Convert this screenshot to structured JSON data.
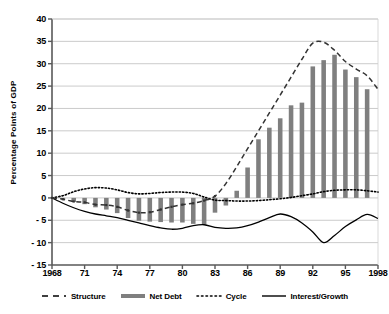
{
  "chart_data": {
    "type": "bar",
    "title": "",
    "xlabel": "",
    "ylabel": "Percentage Points of GDP",
    "ylim": [
      -15,
      40
    ],
    "ytick_values": [
      40,
      35,
      30,
      25,
      20,
      15,
      10,
      5,
      0,
      -5,
      -10,
      -15
    ],
    "ytick_labels": [
      "40",
      "35",
      "30",
      "25",
      "20",
      "15",
      "10",
      "5",
      "0",
      "- 5",
      "- 10",
      "- 15"
    ],
    "grid": true,
    "legend_position": "bottom",
    "x": [
      1968,
      1969,
      1970,
      1971,
      1972,
      1973,
      1974,
      1975,
      1976,
      1977,
      1978,
      1979,
      1980,
      1981,
      1982,
      1983,
      1984,
      1985,
      1986,
      1987,
      1988,
      1989,
      1990,
      1991,
      1992,
      1993,
      1994,
      1995,
      1996,
      1997,
      1998
    ],
    "xtick_values": [
      1968,
      1971,
      1974,
      1977,
      1980,
      1983,
      1986,
      1989,
      1992,
      1995,
      1998
    ],
    "xtick_labels": [
      "1968",
      "71",
      "74",
      "77",
      "80",
      "83",
      "86",
      "89",
      "92",
      "95",
      "1998"
    ],
    "series": [
      {
        "name": "Net Debt",
        "style": "bar",
        "color": "#7f7f7f",
        "values": [
          0.0,
          -0.3,
          -0.9,
          -1.4,
          -2.1,
          -2.6,
          -3.4,
          -4.5,
          -5.1,
          -5.3,
          -5.4,
          -5.5,
          -5.5,
          -5.8,
          -6.0,
          -3.3,
          -1.7,
          1.6,
          6.8,
          13.1,
          15.7,
          17.8,
          20.7,
          21.3,
          29.4,
          30.8,
          32.0,
          28.7,
          27.0,
          24.3,
          0.0
        ]
      },
      {
        "name": "Structure",
        "style": "dashed-marker",
        "color": "#333333",
        "values": [
          0.0,
          -0.3,
          -0.8,
          -1.0,
          -1.5,
          -1.6,
          -2.0,
          -2.8,
          -3.3,
          -3.2,
          -2.6,
          -2.0,
          -1.5,
          -1.2,
          -0.6,
          0.4,
          3.2,
          7.0,
          11.0,
          15.0,
          19.0,
          23.0,
          27.0,
          31.0,
          34.6,
          34.8,
          33.0,
          30.5,
          28.8,
          27.3,
          24.3
        ]
      },
      {
        "name": "Cycle",
        "style": "dotted",
        "color": "#000000",
        "values": [
          0.0,
          0.5,
          1.4,
          2.0,
          2.3,
          2.2,
          1.8,
          1.2,
          0.9,
          1.0,
          1.2,
          1.3,
          1.3,
          1.0,
          0.2,
          -0.5,
          -0.6,
          -0.7,
          -0.7,
          -0.6,
          -0.4,
          -0.2,
          0.1,
          0.5,
          0.9,
          1.4,
          1.7,
          1.8,
          1.8,
          1.6,
          1.3
        ]
      },
      {
        "name": "Interest/Growth",
        "style": "solid",
        "color": "#000000",
        "values": [
          0.0,
          -1.2,
          -2.2,
          -3.0,
          -3.6,
          -4.0,
          -4.4,
          -5.0,
          -5.6,
          -6.2,
          -6.7,
          -7.0,
          -6.8,
          -6.2,
          -6.0,
          -6.6,
          -6.8,
          -6.7,
          -6.2,
          -5.4,
          -4.4,
          -3.6,
          -4.2,
          -5.6,
          -7.6,
          -10.0,
          -8.4,
          -6.4,
          -4.9,
          -3.7,
          -4.6
        ]
      }
    ]
  },
  "legend": {
    "items": [
      {
        "label": "Structure",
        "icon": "dashed-line-icon"
      },
      {
        "label": "Net Debt",
        "icon": "thick-gray-bar-icon"
      },
      {
        "label": "Cycle",
        "icon": "dotted-line-icon"
      },
      {
        "label": "Interest/Growth",
        "icon": "solid-line-icon"
      }
    ]
  },
  "header": {
    "cropped_title": ""
  }
}
